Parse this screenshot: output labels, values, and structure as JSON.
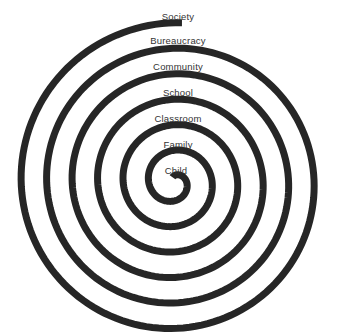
{
  "diagram": {
    "type": "spiral",
    "stroke_color": "#262626",
    "labels": [
      {
        "text": "Society",
        "x": 178,
        "y": 11
      },
      {
        "text": "Bureaucracy",
        "x": 178,
        "y": 35
      },
      {
        "text": "Community",
        "x": 178,
        "y": 61
      },
      {
        "text": "School",
        "x": 178,
        "y": 87
      },
      {
        "text": "Classroom",
        "x": 178,
        "y": 113
      },
      {
        "text": "Family",
        "x": 178,
        "y": 139
      },
      {
        "text": "Child",
        "x": 176,
        "y": 165
      }
    ]
  }
}
